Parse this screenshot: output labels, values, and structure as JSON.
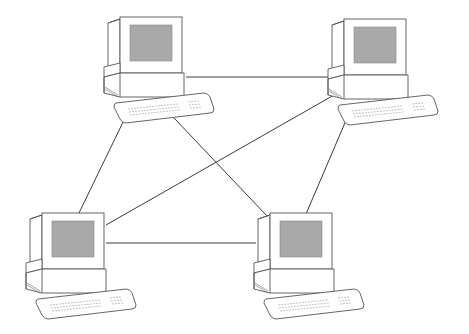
{
  "diagram": {
    "type": "mesh-network",
    "nodes": [
      {
        "id": "computer-top-left",
        "icon": "desktop-computer-icon"
      },
      {
        "id": "computer-top-right",
        "icon": "desktop-computer-icon"
      },
      {
        "id": "computer-bottom-left",
        "icon": "desktop-computer-icon"
      },
      {
        "id": "computer-bottom-right",
        "icon": "desktop-computer-icon"
      }
    ],
    "edges": [
      {
        "from": "computer-top-left",
        "to": "computer-top-right"
      },
      {
        "from": "computer-top-left",
        "to": "computer-bottom-left"
      },
      {
        "from": "computer-top-left",
        "to": "computer-bottom-right"
      },
      {
        "from": "computer-top-right",
        "to": "computer-bottom-left"
      },
      {
        "from": "computer-top-right",
        "to": "computer-bottom-right"
      },
      {
        "from": "computer-bottom-left",
        "to": "computer-bottom-right"
      }
    ],
    "colors": {
      "line": "#3a3a3a",
      "screen": "#a9a9a9",
      "background": "#ffffff"
    }
  }
}
